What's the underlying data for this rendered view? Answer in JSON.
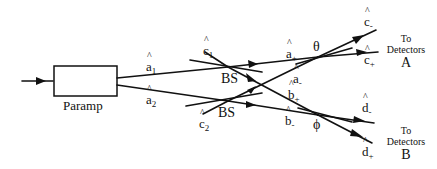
{
  "figure": {
    "type": "optical-setup-diagram",
    "stroke_color": "#111111",
    "background": "#ffffff"
  },
  "paramp": {
    "label": "Paramp"
  },
  "beams": {
    "a1": {
      "base": "a",
      "sub": "1"
    },
    "a2": {
      "base": "a",
      "sub": "2"
    },
    "c1": {
      "base": "c",
      "sub": "1"
    },
    "c2": {
      "base": "c",
      "sub": "2"
    },
    "a_plus": {
      "base": "a",
      "sub": "+"
    },
    "a_minus": {
      "base": "a",
      "sub": "-"
    },
    "b_plus": {
      "base": "b",
      "sub": "+"
    },
    "b_minus": {
      "base": "b",
      "sub": "-"
    },
    "c_minus": {
      "base": "c",
      "sub": "-"
    },
    "c_plus": {
      "base": "c",
      "sub": "+"
    },
    "d_minus": {
      "base": "d",
      "sub": "-"
    },
    "d_plus": {
      "base": "d",
      "sub": "+"
    }
  },
  "beamsplitters": [
    {
      "label": "BS"
    },
    {
      "label": "BS"
    }
  ],
  "phases": {
    "theta": "θ",
    "phi": "ϕ"
  },
  "detectors": {
    "A": {
      "line1": "To",
      "line2": "Detectors",
      "letter": "A"
    },
    "B": {
      "line1": "To",
      "line2": "Detectors",
      "letter": "B"
    }
  }
}
